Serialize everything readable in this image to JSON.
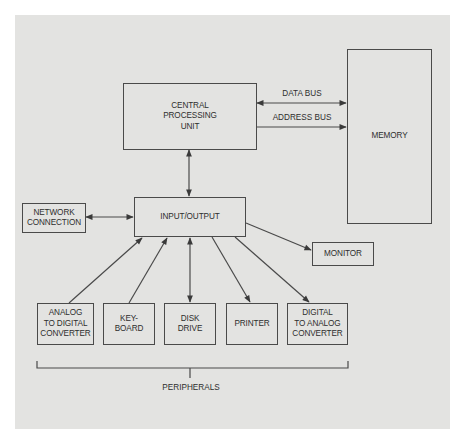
{
  "diagram": {
    "nodes": {
      "cpu": {
        "label": "CENTRAL\nPROCESSING\nUNIT"
      },
      "memory": {
        "label": "MEMORY"
      },
      "io": {
        "label": "INPUT/OUTPUT"
      },
      "network": {
        "label": "NETWORK\nCONNECTION"
      },
      "monitor": {
        "label": "MONITOR"
      },
      "adc": {
        "label": "ANALOG\nTO DIGITAL\nCONVERTER"
      },
      "keyboard": {
        "label": "KEY-\nBOARD"
      },
      "disk": {
        "label": "DISK\nDRIVE"
      },
      "printer": {
        "label": "PRINTER"
      },
      "dac": {
        "label": "DIGITAL\nTO ANALOG\nCONVERTER"
      }
    },
    "edges": {
      "data_bus": {
        "label": "DATA BUS",
        "from": "cpu",
        "to": "memory",
        "direction": "both"
      },
      "address_bus": {
        "label": "ADDRESS BUS",
        "from": "cpu",
        "to": "memory",
        "direction": "forward"
      },
      "cpu_io": {
        "from": "cpu",
        "to": "io",
        "direction": "both"
      },
      "network_io": {
        "from": "network",
        "to": "io",
        "direction": "both"
      },
      "io_monitor": {
        "from": "io",
        "to": "monitor",
        "direction": "forward"
      },
      "adc_io": {
        "from": "adc",
        "to": "io",
        "direction": "forward"
      },
      "keyboard_io": {
        "from": "keyboard",
        "to": "io",
        "direction": "forward"
      },
      "disk_io": {
        "from": "disk",
        "to": "io",
        "direction": "both"
      },
      "io_printer": {
        "from": "io",
        "to": "printer",
        "direction": "forward"
      },
      "io_dac": {
        "from": "io",
        "to": "dac",
        "direction": "forward"
      }
    },
    "group": {
      "label": "PERIPHERALS",
      "members": [
        "adc",
        "keyboard",
        "disk",
        "printer",
        "dac"
      ]
    },
    "colors": {
      "panel": "#e3e3e1",
      "line": "#4a4a4a",
      "text": "#2e2e2e"
    }
  }
}
